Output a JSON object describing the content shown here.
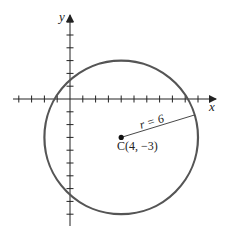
{
  "diagram": {
    "type": "coordinate-plane-circle",
    "axes": {
      "x_label": "x",
      "y_label": "y",
      "unit_px": 12.8,
      "origin_px": [
        70,
        99
      ],
      "x_ticks": [
        -4,
        -3,
        -2,
        -1,
        1,
        2,
        3,
        4,
        5,
        6,
        7,
        8,
        9,
        10
      ],
      "y_ticks": [
        6,
        5,
        4,
        3,
        2,
        1,
        -1,
        -2,
        -3,
        -4,
        -5,
        -6,
        -7,
        -8,
        -9
      ]
    },
    "circle": {
      "center": [
        4,
        -3
      ],
      "radius": 6,
      "stroke_color": "#555555"
    },
    "center_label": "C(4, −3)",
    "radius_label": "r = 6",
    "axis_color": "#222222"
  }
}
